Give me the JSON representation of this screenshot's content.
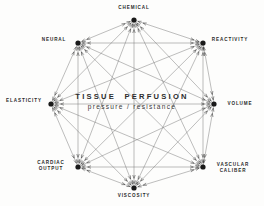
{
  "diagram": {
    "type": "network-octagon",
    "center": {
      "title": "TISSUE  PERFUSION",
      "subtitle": "pressure / resistance"
    },
    "nodes": [
      {
        "id": "chemical",
        "label": "CHEMICAL",
        "x": 134,
        "y": 20,
        "label_x": 134,
        "label_y": 8,
        "align": "center"
      },
      {
        "id": "reactivity",
        "label": "REACTIVITY",
        "x": 203,
        "y": 43,
        "label_x": 230,
        "label_y": 40,
        "align": "center"
      },
      {
        "id": "volume",
        "label": "VOLUME",
        "x": 214,
        "y": 104,
        "label_x": 240,
        "label_y": 104,
        "align": "center"
      },
      {
        "id": "vascular-caliber",
        "label": "VASCULAR\nCALIBER",
        "x": 203,
        "y": 167,
        "label_x": 233,
        "label_y": 168,
        "align": "center"
      },
      {
        "id": "viscosity",
        "label": "VISCOSITY",
        "x": 134,
        "y": 188,
        "label_x": 134,
        "label_y": 196,
        "align": "center"
      },
      {
        "id": "cardiac-output",
        "label": "CARDIAC\nOUTPUT",
        "x": 78,
        "y": 167,
        "label_x": 51,
        "label_y": 166,
        "align": "center"
      },
      {
        "id": "elasticity",
        "label": "ELASTICITY",
        "x": 51,
        "y": 104,
        "label_x": 24,
        "label_y": 101,
        "align": "center"
      },
      {
        "id": "neural",
        "label": "NEURAL",
        "x": 78,
        "y": 43,
        "label_x": 54,
        "label_y": 40,
        "align": "center"
      }
    ],
    "edges": [
      [
        "chemical",
        "reactivity"
      ],
      [
        "chemical",
        "volume"
      ],
      [
        "chemical",
        "vascular-caliber"
      ],
      [
        "chemical",
        "viscosity"
      ],
      [
        "chemical",
        "cardiac-output"
      ],
      [
        "chemical",
        "elasticity"
      ],
      [
        "chemical",
        "neural"
      ],
      [
        "reactivity",
        "volume"
      ],
      [
        "reactivity",
        "vascular-caliber"
      ],
      [
        "reactivity",
        "viscosity"
      ],
      [
        "reactivity",
        "cardiac-output"
      ],
      [
        "reactivity",
        "elasticity"
      ],
      [
        "reactivity",
        "neural"
      ],
      [
        "volume",
        "vascular-caliber"
      ],
      [
        "volume",
        "viscosity"
      ],
      [
        "volume",
        "cardiac-output"
      ],
      [
        "volume",
        "elasticity"
      ],
      [
        "volume",
        "neural"
      ],
      [
        "vascular-caliber",
        "viscosity"
      ],
      [
        "vascular-caliber",
        "cardiac-output"
      ],
      [
        "vascular-caliber",
        "elasticity"
      ],
      [
        "vascular-caliber",
        "neural"
      ],
      [
        "viscosity",
        "cardiac-output"
      ],
      [
        "viscosity",
        "elasticity"
      ],
      [
        "viscosity",
        "neural"
      ],
      [
        "cardiac-output",
        "elasticity"
      ],
      [
        "cardiac-output",
        "neural"
      ],
      [
        "elasticity",
        "neural"
      ]
    ],
    "style": {
      "line_color": "#6d6d6d",
      "node_color": "#1a1a1a",
      "text_color": "#2a2a2a",
      "background": "#fdfdfc"
    }
  }
}
